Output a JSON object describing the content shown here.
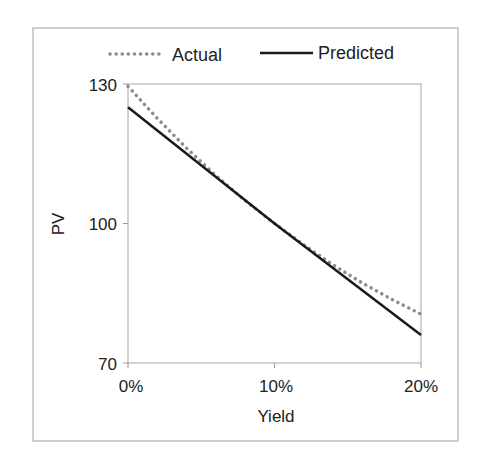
{
  "chart_data": {
    "type": "line",
    "title": "",
    "xlabel": "Yield",
    "ylabel": "PV",
    "x_ticks": [
      "0%",
      "10%",
      "20%"
    ],
    "y_ticks": [
      "70",
      "100",
      "130"
    ],
    "xlim": [
      0,
      0.2
    ],
    "ylim": [
      70,
      130
    ],
    "grid": false,
    "legend_position": "top",
    "series": [
      {
        "name": "Actual",
        "style": "dotted",
        "color": "#8c8c8c",
        "x": [
          0,
          0.02,
          0.04,
          0.06,
          0.08,
          0.1,
          0.12,
          0.14,
          0.16,
          0.18,
          0.2
        ],
        "values": [
          129.5,
          122.6,
          116.2,
          110.3,
          104.9,
          100.0,
          95.4,
          91.1,
          87.2,
          83.7,
          80.5
        ]
      },
      {
        "name": "Predicted",
        "style": "solid",
        "color": "#1a1a1a",
        "x": [
          0,
          0.1,
          0.2
        ],
        "values": [
          125.0,
          100.0,
          76.0
        ]
      }
    ]
  },
  "legend": {
    "actual_label": "Actual",
    "predicted_label": "Predicted"
  },
  "axes": {
    "xlabel": "Yield",
    "ylabel": "PV",
    "x_ticks": [
      "0%",
      "10%",
      "20%"
    ],
    "y_ticks": [
      "130",
      "100",
      "70"
    ]
  }
}
